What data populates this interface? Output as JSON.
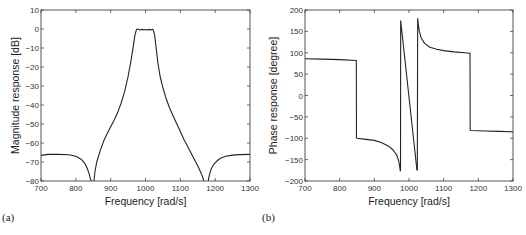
{
  "chart_data": [
    {
      "id": "a",
      "type": "line",
      "panel_label": "(a)",
      "title": "",
      "xlabel": "Frequency [rad/s]",
      "ylabel": "Magnitude response [dB]",
      "xlim": [
        700,
        1300
      ],
      "ylim": [
        -80,
        10
      ],
      "xticks": [
        700,
        800,
        900,
        1000,
        1100,
        1200,
        1300
      ],
      "yticks": [
        10,
        0,
        -10,
        -20,
        -30,
        -40,
        -50,
        -60,
        -70,
        -80
      ],
      "xtick_labels": [
        "700",
        "800",
        "900",
        "1000",
        "1100",
        "1200",
        "1300"
      ],
      "ytick_labels": [
        "10",
        "0",
        "−10",
        "−20",
        "−30",
        "−40",
        "−50",
        "−60",
        "−70",
        "−80"
      ],
      "grid": false,
      "series": [
        {
          "name": "magnitude",
          "segments": [
            {
              "x": [
                700,
                720,
                750,
                780,
                800,
                815,
                825,
                832,
                838,
                842,
                845
              ],
              "y": [
                -66.5,
                -66,
                -66,
                -66.2,
                -67,
                -68.5,
                -70.5,
                -73,
                -76,
                -79,
                -80
              ]
            },
            {
              "x": [
                852,
                855,
                860,
                870,
                880,
                890,
                900,
                910,
                920,
                930,
                940,
                950,
                958,
                965,
                970,
                974,
                978,
                985,
                990,
                995,
                1000,
                1005,
                1010,
                1015,
                1020,
                1022,
                1026,
                1030,
                1035,
                1042,
                1050,
                1060,
                1070,
                1080,
                1090,
                1100,
                1110,
                1120,
                1130,
                1140,
                1150,
                1160,
                1165,
                1168
              ],
              "y": [
                -80,
                -75,
                -70,
                -64,
                -59,
                -55,
                -51.5,
                -48,
                -44,
                -39,
                -33,
                -25,
                -17,
                -9,
                -3,
                -0.3,
                0,
                -0.5,
                -0.2,
                -0.5,
                -0.3,
                -0.5,
                -0.2,
                -0.5,
                -0.2,
                -0.3,
                -3,
                -9,
                -17,
                -25,
                -31,
                -37,
                -42,
                -46,
                -50,
                -54,
                -58,
                -61.5,
                -65,
                -68.5,
                -72,
                -76,
                -78.5,
                -80
              ]
            },
            {
              "x": [
                1180,
                1183,
                1188,
                1195,
                1205,
                1215,
                1230,
                1250,
                1270,
                1300
              ],
              "y": [
                -80,
                -77,
                -74,
                -71.5,
                -69.5,
                -68,
                -67,
                -66.4,
                -66.1,
                -66
              ]
            }
          ]
        }
      ]
    },
    {
      "id": "b",
      "type": "line",
      "panel_label": "(b)",
      "title": "",
      "xlabel": "Frequency [rad/s]",
      "ylabel": "Phase response [degree]",
      "xlim": [
        700,
        1300
      ],
      "ylim": [
        -200,
        200
      ],
      "xticks": [
        700,
        800,
        900,
        1000,
        1100,
        1200,
        1300
      ],
      "yticks": [
        200,
        150,
        100,
        50,
        0,
        -50,
        -100,
        -150,
        -200
      ],
      "xtick_labels": [
        "700",
        "800",
        "900",
        "1000",
        "1100",
        "1200",
        "1300"
      ],
      "ytick_labels": [
        "200",
        "150",
        "100",
        "50",
        "0",
        "−50",
        "−100",
        "−150",
        "−200"
      ],
      "grid": false,
      "series": [
        {
          "name": "phase",
          "segments": [
            {
              "x": [
                700,
                750,
                800,
                848,
                848.5,
                850,
                870,
                900,
                920,
                940,
                955,
                965,
                970,
                973,
                975
              ],
              "y": [
                86,
                85,
                84,
                82,
                -99,
                -100,
                -102,
                -105,
                -110,
                -118,
                -128,
                -140,
                -152,
                -165,
                -177
              ]
            },
            {
              "x": [
                975.5,
                976,
                1023,
                1023.5
              ],
              "y": [
                -177,
                175,
                -175,
                -175
              ]
            },
            {
              "x": [
                1024,
                1025,
                1027,
                1030,
                1035,
                1045,
                1060,
                1080,
                1100,
                1130,
                1160,
                1176,
                1176.5,
                1178,
                1220,
                1260,
                1300
              ],
              "y": [
                -175,
                180,
                165,
                150,
                135,
                122,
                113,
                108,
                105,
                102,
                100,
                99,
                -81,
                -82,
                -83,
                -84,
                -85
              ]
            }
          ]
        }
      ]
    }
  ]
}
